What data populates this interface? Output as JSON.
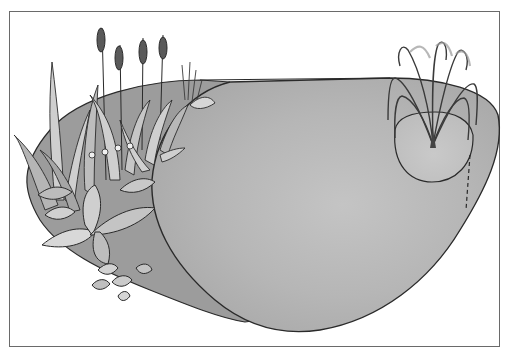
{
  "image": {
    "description": "Grayscale illustration of a garden pond with marginal plants (cattails, irises, hostas) on the left shelf and a fountain on the right",
    "colors": {
      "background": "#ffffff",
      "frame": "#6a6a6a",
      "water": "#b9b9b9",
      "shelf": "#9c9c9c",
      "outline": "#2a2a2a",
      "leaf_light": "#d4d4d4",
      "leaf_mid": "#a8a8a8",
      "leaf_dark": "#5e5e5e"
    },
    "elements": [
      {
        "name": "pond-water",
        "label": "Pond"
      },
      {
        "name": "planting-shelf",
        "label": "Planting shelf"
      },
      {
        "name": "cattails",
        "label": "Cattails"
      },
      {
        "name": "iris-leaves",
        "label": "Iris leaves"
      },
      {
        "name": "hosta-leaves",
        "label": "Hosta leaves"
      },
      {
        "name": "fountain",
        "label": "Fountain"
      }
    ]
  }
}
